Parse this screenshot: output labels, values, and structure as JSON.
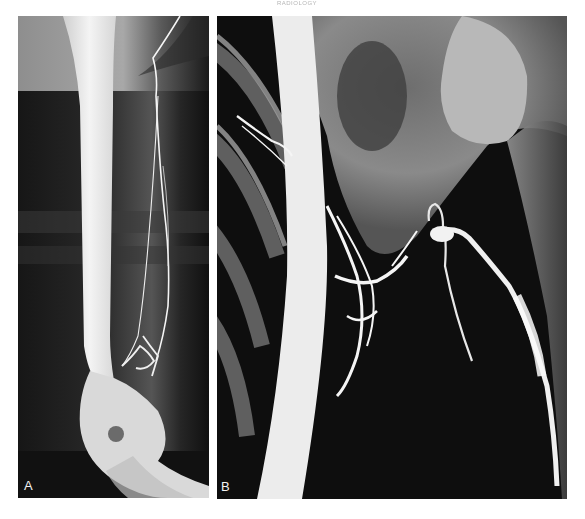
{
  "page": {
    "running_head": "RADIOLOGY"
  },
  "figure": {
    "panels": [
      {
        "id": "A",
        "label": "A",
        "description": "Radiograph of upper arm with humerus shaft and contrast-filled vessels along medial side, elbow at bottom",
        "icon": "xray-arm-image"
      },
      {
        "id": "B",
        "label": "B",
        "description": "Radiograph of shoulder/axilla region with ribs, clavicle, humeral head and contrast-filled tortuous vessels",
        "icon": "xray-shoulder-image"
      }
    ],
    "colors": {
      "background": "#ffffff",
      "film_dark": "#0d0d0d",
      "bone_bright": "#eeeeee",
      "soft_tissue_gray": "#7a7a7a"
    }
  }
}
